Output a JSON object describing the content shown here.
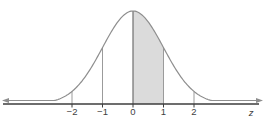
{
  "chart_data": {
    "type": "area",
    "title": "",
    "curve": {
      "distribution": "normal",
      "mean": 0,
      "sd": 1
    },
    "xlabel": "z",
    "x_ticks": [
      -2,
      -1,
      0,
      1,
      2
    ],
    "x_tick_labels": [
      "−2",
      "−1",
      "0",
      "1",
      "2"
    ],
    "vertical_guides_at": [
      -2,
      -1,
      0,
      1,
      2
    ],
    "shaded_interval": [
      0,
      1
    ],
    "axis_arrows": "both",
    "grid": false,
    "legend": false,
    "x_axis_range_shown": [
      -4.2,
      4.1
    ],
    "colors": {
      "background": "#ffffff",
      "curve_stroke": "#8e8e8e",
      "shaded_fill": "#dbdbdb",
      "guide_line": "#9b9b9b",
      "center_guide_line": "#6f6f6f",
      "axis_line": "#3d3d3d",
      "tick_label": "#3f3f3f",
      "arrow_fill": "#8e8e8e"
    }
  }
}
